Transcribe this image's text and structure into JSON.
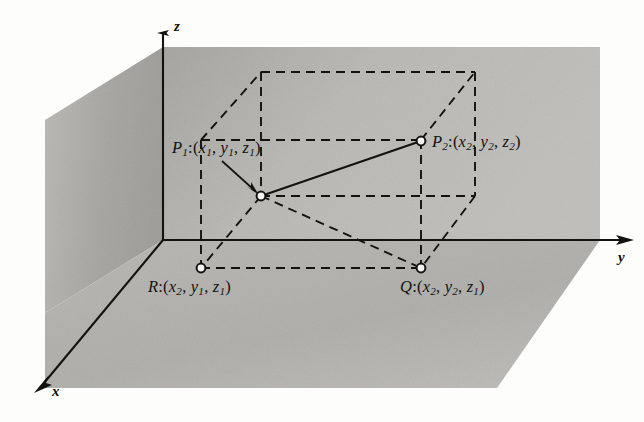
{
  "figure": {
    "kind": "3d-coordinate-diagram",
    "background_color": "#fdfdfc",
    "plane_fill_color": "#b6b5b1",
    "line_color": "#14120f"
  },
  "axes": {
    "x": {
      "label": "x",
      "direction": "down-left"
    },
    "y": {
      "label": "y",
      "direction": "right"
    },
    "z": {
      "label": "z",
      "direction": "up"
    }
  },
  "points": {
    "p1": {
      "name": "P",
      "name_sub": "1",
      "colon": ":",
      "open": "(",
      "coords": [
        {
          "var": "x",
          "sub": "1"
        },
        {
          "var": "y",
          "sub": "1"
        },
        {
          "var": "z",
          "sub": "1"
        }
      ],
      "close": ")",
      "text": "P1:(x1, y1, z1)"
    },
    "p2": {
      "name": "P",
      "name_sub": "2",
      "colon": ":",
      "open": "(",
      "coords": [
        {
          "var": "x",
          "sub": "2"
        },
        {
          "var": "y",
          "sub": "2"
        },
        {
          "var": "z",
          "sub": "2"
        }
      ],
      "close": ")",
      "text": "P2:(x2, y2, z2)"
    },
    "r": {
      "name": "R",
      "name_sub": "",
      "colon": ":",
      "open": "(",
      "coords": [
        {
          "var": "x",
          "sub": "2"
        },
        {
          "var": "y",
          "sub": "1"
        },
        {
          "var": "z",
          "sub": "1"
        }
      ],
      "close": ")",
      "text": "R:(x2, y1, z1)"
    },
    "q": {
      "name": "Q",
      "name_sub": "",
      "colon": ":",
      "open": "(",
      "coords": [
        {
          "var": "x",
          "sub": "2"
        },
        {
          "var": "y",
          "sub": "2"
        },
        {
          "var": "z",
          "sub": "1"
        }
      ],
      "close": ")",
      "text": "Q:(x2, y2, z1)"
    }
  },
  "separators": {
    "comma": ",",
    "space": " "
  }
}
